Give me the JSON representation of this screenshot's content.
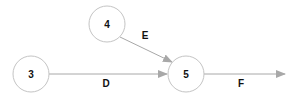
{
  "diagram": {
    "type": "network-graph",
    "colors": {
      "node_stroke": "#c4c4c4",
      "edge": "#a8a8a8",
      "text": "#111111"
    },
    "nodes": [
      {
        "id": "3",
        "label": "3",
        "cx": 31,
        "cy": 74
      },
      {
        "id": "4",
        "label": "4",
        "cx": 107,
        "cy": 24
      },
      {
        "id": "5",
        "label": "5",
        "cx": 186,
        "cy": 74
      }
    ],
    "edges": [
      {
        "id": "D",
        "label": "D",
        "from": "3",
        "to": "5"
      },
      {
        "id": "E",
        "label": "E",
        "from": "4",
        "to": "5"
      },
      {
        "id": "F",
        "label": "F",
        "from": "5",
        "to": null
      }
    ]
  }
}
